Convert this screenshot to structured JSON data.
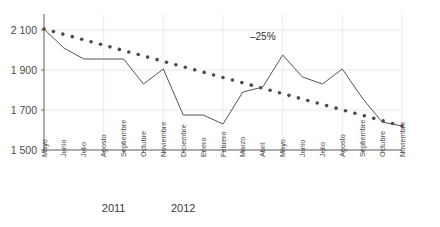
{
  "chart_data": {
    "type": "line",
    "title": "",
    "xlabel": "",
    "ylabel": "",
    "ylim": [
      1500,
      2180
    ],
    "yticks": [
      1500,
      1700,
      1900,
      2100
    ],
    "ytick_labels": [
      "1 500",
      "1 700",
      "1 900",
      "2 100"
    ],
    "grid": true,
    "legend_position": "none",
    "categories": [
      "Mayo",
      "Junio",
      "Julio",
      "Agosto",
      "Septiembre",
      "Octubre",
      "Noviembre",
      "Diciembre",
      "Enero",
      "Febrero",
      "Marzo",
      "Abril",
      "Mayo",
      "Junio",
      "Julio",
      "Agosto",
      "Septiembre",
      "Octubre",
      "Noviembre"
    ],
    "series": [
      {
        "name": "serie-mensual",
        "style": "solid-line",
        "color": "#555555",
        "values": [
          2105,
          2010,
          1955,
          1955,
          1955,
          1830,
          1905,
          1675,
          1675,
          1630,
          1790,
          1815,
          1975,
          1865,
          1830,
          1905,
          1760,
          1640,
          1620
        ]
      },
      {
        "name": "linea-tendencia",
        "style": "dotted-line",
        "color": "#4a4a4a",
        "values": [
          2105,
          2078,
          2051,
          2024,
          1997,
          1970,
          1943,
          1916,
          1889,
          1862,
          1835,
          1808,
          1781,
          1754,
          1727,
          1700,
          1673,
          1646,
          1620
        ]
      }
    ],
    "annotations": [
      {
        "name": "trend-change-label",
        "text": "–25%",
        "x_category": "Abril",
        "y_value": 2050
      }
    ],
    "year_groups": [
      {
        "label": "2011",
        "start_category": "Mayo",
        "end_category": "Diciembre"
      },
      {
        "label": "2012",
        "start_category": "Enero",
        "end_category": "Noviembre"
      }
    ]
  }
}
